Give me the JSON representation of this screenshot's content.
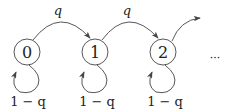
{
  "diagram": {
    "type": "markov-chain",
    "states": [
      {
        "id": "0",
        "label": "0",
        "self_loop_label": "1 − q"
      },
      {
        "id": "1",
        "label": "1",
        "self_loop_label": "1 − q"
      },
      {
        "id": "2",
        "label": "2",
        "self_loop_label": "1 − q"
      }
    ],
    "transitions": [
      {
        "from": "0",
        "to": "1",
        "label": "q"
      },
      {
        "from": "1",
        "to": "2",
        "label": "q"
      },
      {
        "from": "2",
        "to": "…",
        "label": ""
      }
    ],
    "continuation": "···",
    "colors": {
      "stroke": "#444444",
      "text": "#222222",
      "background": "#ffffff"
    }
  }
}
